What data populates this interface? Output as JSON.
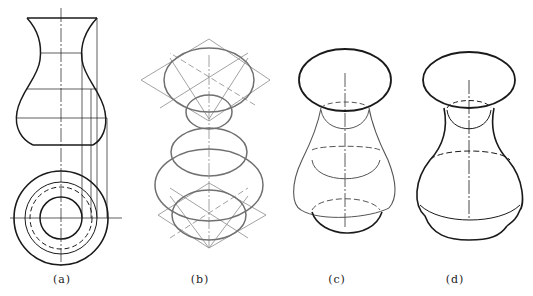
{
  "figure": {
    "panels": [
      {
        "id": "a",
        "label": "(a)",
        "x": 62,
        "content": "front view and top view of vase"
      },
      {
        "id": "b",
        "label": "(b)",
        "x": 200,
        "content": "isometric ellipses construction with rhombus method"
      },
      {
        "id": "c",
        "label": "(c)",
        "x": 337,
        "content": "isometric contour with hidden lines dashed"
      },
      {
        "id": "d",
        "label": "(d)",
        "x": 455,
        "content": "finished isometric vase"
      }
    ],
    "colors": {
      "line": "#1a1a1a",
      "construction": "#8a8a8a",
      "gray_curve": "#707070"
    }
  }
}
